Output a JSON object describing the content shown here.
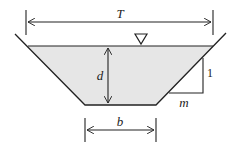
{
  "diagram": {
    "labels": {
      "top_width": "T",
      "depth": "d",
      "bottom_width": "b",
      "slope_rise": "1",
      "slope_run": "m"
    },
    "symbols": {
      "water_surface": "water-surface-triangle"
    },
    "colors": {
      "water_fill": "#e6e6e6",
      "line": "#222222"
    }
  }
}
